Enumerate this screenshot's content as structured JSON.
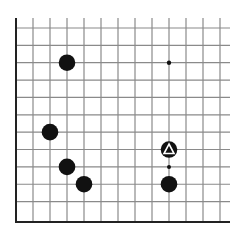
{
  "diagram": {
    "type": "go-board-corner",
    "corner": "bottom-left",
    "columns": 13,
    "rows": 12,
    "origin_x": 16,
    "origin_y": 28,
    "spacing_x": 17,
    "spacing_y": 17.36,
    "line_color": "#8a8a8a",
    "edge_color": "#222222",
    "stone_color": "#111111",
    "stones": [
      {
        "color": "black",
        "col": 3,
        "row": 2,
        "marker": null
      },
      {
        "color": "black",
        "col": 2,
        "row": 6,
        "marker": null
      },
      {
        "color": "black",
        "col": 3,
        "row": 8,
        "marker": null
      },
      {
        "color": "black",
        "col": 4,
        "row": 9,
        "marker": null
      },
      {
        "color": "black",
        "col": 9,
        "row": 7,
        "marker": "triangle"
      },
      {
        "color": "black",
        "col": 9,
        "row": 9,
        "marker": null
      }
    ],
    "points": [
      {
        "kind": "hoshi",
        "col": 9,
        "row": 2
      },
      {
        "kind": "small-dot",
        "col": 9,
        "row": 8
      }
    ]
  }
}
